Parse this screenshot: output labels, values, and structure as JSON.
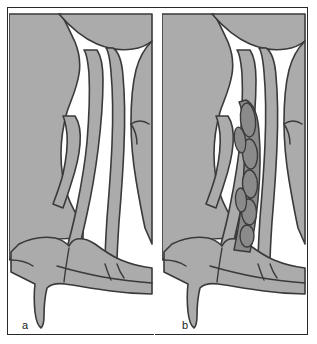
{
  "figure": {
    "width": 317,
    "height": 344
  },
  "colors": {
    "background": "#ffffff",
    "frame_border": "#2a2a2a",
    "tissue_fill": "#ababab",
    "tissue_outline": "#3a3a3a",
    "polyp_fill": "#8a8a8a",
    "polyp_outline": "#3a3a3a",
    "airway": "#ffffff",
    "label_text": "#1a1a1a"
  },
  "panels": [
    {
      "id": "a",
      "label": "a",
      "caption": "Normal sinonasal anatomy",
      "has_polyps": false,
      "structures": [
        "skull base",
        "lateral nasal wall",
        "middle turbinate",
        "nasal septum",
        "inferior turbinate",
        "nasal floor",
        "middle meatus",
        "maxillary sinus ostium"
      ]
    },
    {
      "id": "b",
      "label": "b",
      "caption": "Nasal polyposis filling the middle meatus",
      "has_polyps": true,
      "polyp_count": 7,
      "structures": [
        "skull base",
        "lateral nasal wall",
        "middle turbinate",
        "nasal septum",
        "inferior turbinate",
        "nasal floor",
        "middle meatus",
        "maxillary sinus ostium",
        "nasal polyps"
      ]
    }
  ]
}
